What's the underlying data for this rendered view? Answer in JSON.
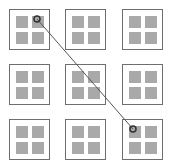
{
  "grid": {
    "rows": 3,
    "cols": 3,
    "cell_positions": [
      {
        "row": 0,
        "col": 0,
        "x": 9,
        "y": 9
      },
      {
        "row": 0,
        "col": 1,
        "x": 65,
        "y": 9
      },
      {
        "row": 0,
        "col": 2,
        "x": 122,
        "y": 9
      },
      {
        "row": 1,
        "col": 0,
        "x": 9,
        "y": 64
      },
      {
        "row": 1,
        "col": 1,
        "x": 65,
        "y": 64
      },
      {
        "row": 1,
        "col": 2,
        "x": 122,
        "y": 64
      },
      {
        "row": 2,
        "col": 0,
        "x": 9,
        "y": 119
      },
      {
        "row": 2,
        "col": 1,
        "x": 65,
        "y": 119
      },
      {
        "row": 2,
        "col": 2,
        "x": 122,
        "y": 119
      }
    ],
    "inner_squares_per_cell": 4
  },
  "connection": {
    "from": {
      "cell_row": 0,
      "cell_col": 0,
      "square": "top-right",
      "x": 37,
      "y": 19
    },
    "to": {
      "cell_row": 2,
      "cell_col": 2,
      "square": "top-left",
      "x": 133,
      "y": 129
    }
  },
  "colors": {
    "cell_border": "#6e6e6e",
    "square_fill": "#a9a9a9",
    "line": "#555555",
    "marker": "#333333"
  }
}
